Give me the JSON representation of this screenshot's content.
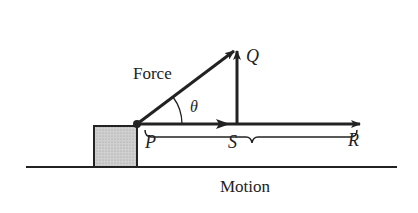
{
  "diagram": {
    "labels": {
      "force": "Force",
      "theta": "θ",
      "P": "P",
      "Q": "Q",
      "S": "S",
      "R": "R",
      "motion": "Motion"
    },
    "colors": {
      "ink": "#222222",
      "block_fill": "#c8c8c8",
      "background": "#ffffff"
    }
  }
}
